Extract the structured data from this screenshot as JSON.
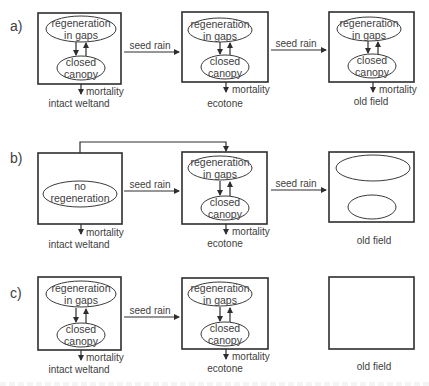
{
  "panels": [
    {
      "label": "a)",
      "states": [
        {
          "name": "intact weltand",
          "top": "regeneration",
          "top2": "in gaps",
          "bottom": "closed",
          "bottom2": "canopy",
          "mortality": "mortality"
        },
        {
          "name": "ecotone",
          "top": "regeneration",
          "top2": "in gaps",
          "bottom": "closed",
          "bottom2": "canopy",
          "mortality": "mortality"
        },
        {
          "name": "old field",
          "top": "regeneration",
          "top2": "in gaps",
          "bottom": "closed",
          "bottom2": "canopy",
          "mortality": "mortality"
        }
      ],
      "arrows": [
        "seed rain",
        "seed rain"
      ]
    },
    {
      "label": "b)",
      "states": [
        {
          "name": "intact weltand",
          "center": "no",
          "center2": "regeneration",
          "mortality": "mortality"
        },
        {
          "name": "ecotone",
          "top": "regeneration",
          "top2": "in gaps",
          "bottom": "closed",
          "bottom2": "canopy",
          "mortality": "mortality"
        },
        {
          "name": "old field"
        }
      ],
      "arrows": [
        "seed rain",
        "seed rain"
      ]
    },
    {
      "label": "c)",
      "states": [
        {
          "name": "intact weltand",
          "top": "regeneration",
          "top2": "in gaps",
          "bottom": "closed",
          "bottom2": "canopy",
          "mortality": "mortality"
        },
        {
          "name": "ecotone",
          "top": "regeneration",
          "top2": "in gaps",
          "bottom": "closed",
          "bottom2": "canopy",
          "mortality": "mortality"
        },
        {
          "name": "old field"
        }
      ],
      "arrows": [
        "seed rain"
      ]
    }
  ],
  "colors": {
    "line": "#2e2e2e",
    "text": "#404040",
    "background": "#ffffff"
  }
}
